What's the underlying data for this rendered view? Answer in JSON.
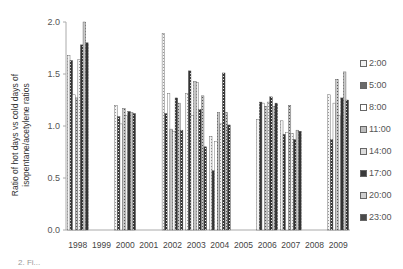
{
  "chart_data": {
    "type": "bar",
    "title": "",
    "xlabel": "",
    "ylabel": "Ratio of  hot days vs cold days of isopentane/acetylene ratios",
    "ylabel_lines": [
      "Ratio of  hot days vs cold days of",
      "isopentane/acetylene ratios"
    ],
    "ylim": [
      0.0,
      2.0
    ],
    "yticks": [
      "0.0",
      "0.5",
      "1.0",
      "1.5",
      "2.0"
    ],
    "grid": false,
    "legend_position": "right",
    "categories": [
      "1998",
      "1999",
      "2000",
      "2001",
      "2002",
      "2003",
      "2004",
      "2005",
      "2006",
      "2007",
      "2008",
      "2009"
    ],
    "series": [
      {
        "name": "2:00",
        "fill": "#f2f2f2",
        "pattern": "light",
        "values": [
          1.68,
          0,
          1.2,
          0,
          1.89,
          1.31,
          0.9,
          0,
          1.06,
          1.05,
          0,
          1.3
        ]
      },
      {
        "name": "5:00",
        "fill": "#6a6a6a",
        "pattern": "dark",
        "values": [
          1.63,
          0,
          1.09,
          0,
          1.12,
          1.53,
          0.57,
          0,
          1.23,
          0.92,
          0,
          0.87
        ]
      },
      {
        "name": "8:00",
        "fill": "#ffffff",
        "pattern": "none",
        "values": [
          1.3,
          0,
          1.02,
          0,
          1.31,
          1.1,
          0.85,
          0,
          1.22,
          0.94,
          0,
          1.22
        ]
      },
      {
        "name": "11:00",
        "fill": "#bdbdbd",
        "pattern": "medium",
        "values": [
          1.27,
          0,
          1.17,
          0,
          0.97,
          1.43,
          1.13,
          0,
          1.19,
          1.2,
          0,
          1.45
        ]
      },
      {
        "name": "14:00",
        "fill": "#dcdcdc",
        "pattern": "light",
        "values": [
          1.64,
          0,
          1.1,
          0,
          0.95,
          1.42,
          1.02,
          0,
          1.23,
          0.93,
          0,
          1.1
        ]
      },
      {
        "name": "17:00",
        "fill": "#3a3a3a",
        "pattern": "dark",
        "values": [
          1.78,
          0,
          1.14,
          0,
          1.27,
          1.16,
          1.51,
          0,
          1.28,
          0.87,
          0,
          1.27
        ]
      },
      {
        "name": "20:00",
        "fill": "#cfcfcf",
        "pattern": "medium",
        "values": [
          2.0,
          0,
          1.13,
          0,
          1.22,
          1.29,
          1.13,
          0,
          1.19,
          0.96,
          0,
          1.52
        ]
      },
      {
        "name": "23:00",
        "fill": "#4a4a4a",
        "pattern": "dark",
        "values": [
          1.8,
          0,
          1.12,
          0,
          0.96,
          0.8,
          1.01,
          0,
          1.22,
          0.95,
          0,
          1.25
        ]
      }
    ]
  },
  "caption": "2.  Fi..."
}
